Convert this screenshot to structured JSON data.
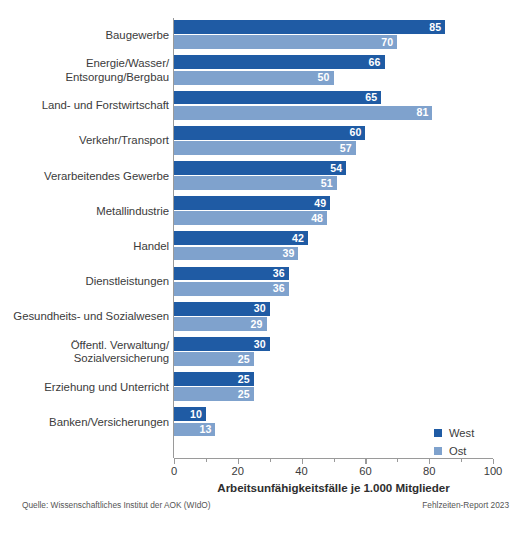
{
  "chart_data": {
    "type": "bar",
    "orientation": "horizontal",
    "title": "",
    "xlabel": "Arbeitsunfähigkeitsfälle je 1.000 Mitglieder",
    "ylabel": "",
    "xlim": [
      0,
      100
    ],
    "xticks": [
      0,
      20,
      40,
      60,
      80,
      100
    ],
    "xtick_labels": [
      "0",
      "20",
      "40",
      "60",
      "80",
      "100"
    ],
    "minor_xticks": [
      10,
      30,
      50,
      70,
      90
    ],
    "grid": false,
    "legend_position": "bottom-right",
    "categories": [
      "Baugewerbe",
      "Energie/Wasser/\nEntsorgung/Bergbau",
      "Land- und Forstwirtschaft",
      "Verkehr/Transport",
      "Verarbeitendes Gewerbe",
      "Metallindustrie",
      "Handel",
      "Dienstleistungen",
      "Gesundheits- und Sozialwesen",
      "Öffentl. Verwaltung/\nSozialversicherung",
      "Erziehung und Unterricht",
      "Banken/Versicherungen"
    ],
    "category_lines": [
      [
        "Baugewerbe"
      ],
      [
        "Energie/Wasser/",
        "Entsorgung/Bergbau"
      ],
      [
        "Land- und Forstwirtschaft"
      ],
      [
        "Verkehr/Transport"
      ],
      [
        "Verarbeitendes Gewerbe"
      ],
      [
        "Metallindustrie"
      ],
      [
        "Handel"
      ],
      [
        "Dienstleistungen"
      ],
      [
        "Gesundheits- und Sozialwesen"
      ],
      [
        "Öffentl. Verwaltung/",
        "Sozialversicherung"
      ],
      [
        "Erziehung und Unterricht"
      ],
      [
        "Banken/Versicherungen"
      ]
    ],
    "series": [
      {
        "name": "West",
        "color": "#1f5ba4",
        "values": [
          85,
          66,
          65,
          60,
          54,
          49,
          42,
          36,
          30,
          30,
          25,
          10
        ]
      },
      {
        "name": "Ost",
        "color": "#7fa2cd",
        "values": [
          70,
          50,
          81,
          57,
          51,
          48,
          39,
          36,
          29,
          25,
          25,
          13
        ]
      }
    ]
  },
  "legend": {
    "items": [
      {
        "label": "West",
        "color": "#1f5ba4"
      },
      {
        "label": "Ost",
        "color": "#7fa2cd"
      }
    ]
  },
  "footer": {
    "source": "Quelle: Wissenschaftliches Institut der AOK (WIdO)",
    "report": "Fehlzeiten-Report 2023"
  },
  "colors": {
    "west": "#1f5ba4",
    "ost": "#7fa2cd",
    "axis": "#9a9a9a",
    "text": "#3b3b3b",
    "background": "#ffffff"
  }
}
